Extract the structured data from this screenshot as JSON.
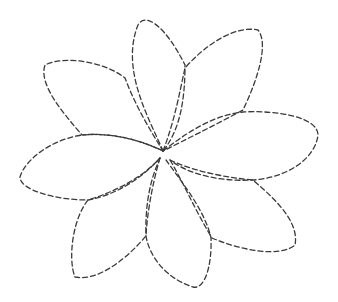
{
  "drawing": {
    "subject": "dashed outline of an eight-petal flower",
    "stroke_color": "#3a3a3a",
    "background_color": "#ffffff",
    "center": [
      163,
      151
    ],
    "petals": [
      {
        "name": "top",
        "d": "M163 151 C 150 120, 120 70, 138 25 C 145 12, 165 25, 185 65 C 185 100, 180 130, 163 151"
      },
      {
        "name": "top-right",
        "d": "M163 151 C 175 120, 180 90, 185 68 C 205 45, 235 25, 258 30 C 270 45, 255 85, 243 110 C 215 125, 185 140, 163 151"
      },
      {
        "name": "right",
        "d": "M163 151 C 190 130, 215 115, 243 112 C 280 110, 318 118, 318 135 C 315 160, 285 178, 253 180 C 215 182, 185 172, 170 160"
      },
      {
        "name": "bottom-right",
        "d": "M170 160 C 195 172, 230 178, 253 180 C 270 195, 300 220, 295 245 C 280 258, 240 250, 212 238 C 195 210, 182 180, 170 160"
      },
      {
        "name": "bottom",
        "d": "M166 160 C 180 180, 205 210, 211 238 C 212 265, 205 290, 193 287 C 170 280, 150 260, 146 236 C 145 205, 150 180, 160 158"
      },
      {
        "name": "bottom-left",
        "d": "M160 158 C 152 185, 147 215, 146 236 C 130 255, 100 282, 75 277 C 68 260, 72 220, 88 200 C 120 190, 145 175, 160 158"
      },
      {
        "name": "left",
        "d": "M160 158 C 140 180, 115 195, 88 200 C 55 200, 20 190, 20 177 C 25 160, 50 140, 82 135 C 115 132, 145 142, 163 151"
      },
      {
        "name": "top-left",
        "d": "M163 151 C 140 140, 110 132, 82 135 C 65 115, 38 85, 45 65 C 65 55, 105 62, 125 78 C 135 105, 150 130, 163 151"
      }
    ]
  }
}
